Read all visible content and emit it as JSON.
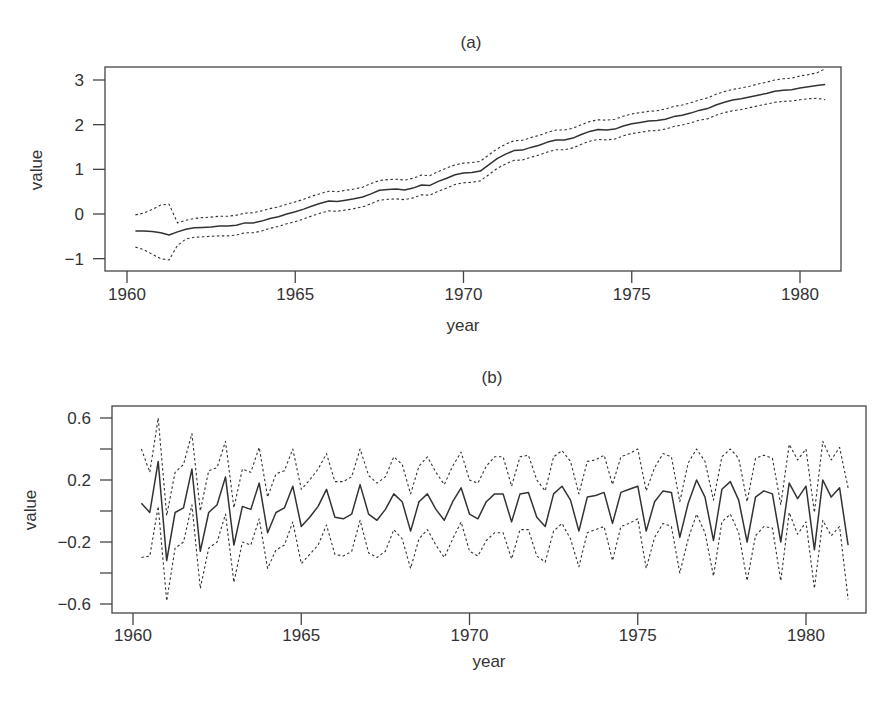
{
  "chart_data": [
    {
      "type": "line",
      "title": "(a)",
      "xlabel": "year",
      "ylabel": "value",
      "xlim": [
        1960,
        1981
      ],
      "ylim": [
        -1.2,
        3.3
      ],
      "xticks": [
        1960,
        1965,
        1970,
        1975,
        1980
      ],
      "yticks": [
        -1,
        0,
        1,
        2,
        3
      ],
      "ytick_labels": [
        "−1",
        "0",
        "1",
        "2",
        "3"
      ],
      "grid": false,
      "legend": null,
      "x_start": 1960.25,
      "x_step": 0.25,
      "series": [
        {
          "name": "estimate",
          "style": "solid",
          "values": [
            -0.38,
            -0.38,
            -0.39,
            -0.42,
            -0.47,
            -0.4,
            -0.34,
            -0.31,
            -0.3,
            -0.29,
            -0.27,
            -0.27,
            -0.25,
            -0.2,
            -0.2,
            -0.16,
            -0.1,
            -0.06,
            0.0,
            0.05,
            0.11,
            0.18,
            0.24,
            0.29,
            0.28,
            0.31,
            0.34,
            0.38,
            0.45,
            0.53,
            0.55,
            0.56,
            0.54,
            0.58,
            0.65,
            0.64,
            0.73,
            0.8,
            0.88,
            0.92,
            0.93,
            0.96,
            1.1,
            1.24,
            1.34,
            1.42,
            1.43,
            1.49,
            1.54,
            1.61,
            1.66,
            1.66,
            1.7,
            1.78,
            1.85,
            1.89,
            1.88,
            1.9,
            1.97,
            2.02,
            2.05,
            2.08,
            2.09,
            2.12,
            2.18,
            2.21,
            2.26,
            2.32,
            2.36,
            2.44,
            2.5,
            2.55,
            2.58,
            2.62,
            2.66,
            2.7,
            2.75,
            2.77,
            2.78,
            2.82,
            2.85,
            2.88,
            2.9
          ]
        },
        {
          "name": "upper",
          "style": "dotted",
          "values": [
            -0.02,
            0.02,
            0.1,
            0.2,
            0.22,
            -0.2,
            -0.14,
            -0.1,
            -0.08,
            -0.07,
            -0.05,
            -0.05,
            -0.03,
            0.02,
            0.03,
            0.07,
            0.12,
            0.16,
            0.22,
            0.27,
            0.33,
            0.4,
            0.46,
            0.51,
            0.5,
            0.53,
            0.56,
            0.6,
            0.68,
            0.75,
            0.77,
            0.78,
            0.76,
            0.8,
            0.87,
            0.86,
            0.95,
            1.03,
            1.1,
            1.14,
            1.15,
            1.18,
            1.32,
            1.46,
            1.56,
            1.64,
            1.65,
            1.71,
            1.76,
            1.83,
            1.88,
            1.88,
            1.92,
            2.0,
            2.07,
            2.11,
            2.1,
            2.12,
            2.19,
            2.24,
            2.27,
            2.3,
            2.31,
            2.35,
            2.41,
            2.44,
            2.49,
            2.55,
            2.6,
            2.68,
            2.74,
            2.79,
            2.82,
            2.86,
            2.91,
            2.95,
            3.0,
            3.03,
            3.04,
            3.09,
            3.12,
            3.16,
            3.25
          ]
        },
        {
          "name": "lower",
          "style": "dotted",
          "values": [
            -0.74,
            -0.8,
            -0.9,
            -1.0,
            -1.03,
            -0.7,
            -0.56,
            -0.52,
            -0.51,
            -0.5,
            -0.49,
            -0.49,
            -0.47,
            -0.42,
            -0.42,
            -0.38,
            -0.32,
            -0.28,
            -0.22,
            -0.17,
            -0.11,
            -0.04,
            0.02,
            0.07,
            0.06,
            0.09,
            0.12,
            0.16,
            0.23,
            0.31,
            0.33,
            0.34,
            0.32,
            0.36,
            0.43,
            0.42,
            0.51,
            0.58,
            0.66,
            0.7,
            0.71,
            0.74,
            0.88,
            1.02,
            1.12,
            1.2,
            1.21,
            1.27,
            1.32,
            1.39,
            1.44,
            1.44,
            1.48,
            1.56,
            1.63,
            1.67,
            1.66,
            1.68,
            1.75,
            1.8,
            1.83,
            1.86,
            1.87,
            1.9,
            1.96,
            1.99,
            2.04,
            2.1,
            2.13,
            2.21,
            2.27,
            2.31,
            2.34,
            2.38,
            2.42,
            2.46,
            2.5,
            2.52,
            2.53,
            2.56,
            2.58,
            2.59,
            2.56
          ]
        }
      ]
    },
    {
      "type": "line",
      "title": "(b)",
      "xlabel": "year",
      "ylabel": "value",
      "xlim": [
        1960,
        1981
      ],
      "ylim": [
        -0.67,
        0.64
      ],
      "xticks": [
        1960,
        1965,
        1970,
        1975,
        1980
      ],
      "yticks": [
        -0.6,
        -0.4,
        -0.2,
        0.0,
        0.2,
        0.4,
        0.6
      ],
      "ytick_labels": [
        "−0.6",
        "",
        "−0.2",
        "",
        "0.2",
        "",
        "0.6"
      ],
      "grid": false,
      "legend": null,
      "x_start": 1960.25,
      "x_step": 0.25,
      "series": [
        {
          "name": "estimate",
          "style": "solid",
          "values": [
            0.05,
            -0.01,
            0.32,
            -0.32,
            -0.01,
            0.02,
            0.27,
            -0.26,
            -0.01,
            0.04,
            0.22,
            -0.22,
            0.03,
            0.01,
            0.18,
            -0.14,
            -0.01,
            0.02,
            0.16,
            -0.1,
            -0.04,
            0.03,
            0.14,
            -0.04,
            -0.05,
            -0.02,
            0.17,
            -0.02,
            -0.06,
            0.01,
            0.11,
            0.06,
            -0.13,
            0.06,
            0.11,
            0.01,
            -0.06,
            0.06,
            0.15,
            -0.02,
            -0.05,
            0.06,
            0.11,
            0.11,
            -0.07,
            0.11,
            0.12,
            -0.04,
            -0.1,
            0.11,
            0.16,
            0.07,
            -0.13,
            0.09,
            0.1,
            0.12,
            -0.08,
            0.12,
            0.14,
            0.16,
            -0.13,
            0.06,
            0.13,
            0.12,
            -0.17,
            0.05,
            0.2,
            0.09,
            -0.19,
            0.14,
            0.19,
            0.07,
            -0.2,
            0.09,
            0.13,
            0.11,
            -0.2,
            0.18,
            0.08,
            0.16,
            -0.25,
            0.2,
            0.09,
            0.15,
            -0.22
          ]
        },
        {
          "name": "upper",
          "style": "dotted",
          "values": [
            0.4,
            0.25,
            0.6,
            -0.03,
            0.25,
            0.3,
            0.5,
            0.0,
            0.26,
            0.28,
            0.45,
            0.02,
            0.27,
            0.25,
            0.41,
            0.09,
            0.24,
            0.26,
            0.4,
            0.14,
            0.2,
            0.27,
            0.37,
            0.19,
            0.19,
            0.22,
            0.4,
            0.23,
            0.18,
            0.22,
            0.35,
            0.3,
            0.11,
            0.29,
            0.35,
            0.25,
            0.17,
            0.29,
            0.38,
            0.2,
            0.18,
            0.29,
            0.35,
            0.35,
            0.16,
            0.35,
            0.36,
            0.2,
            0.13,
            0.35,
            0.39,
            0.32,
            0.11,
            0.32,
            0.33,
            0.36,
            0.17,
            0.35,
            0.37,
            0.4,
            0.13,
            0.28,
            0.37,
            0.35,
            0.06,
            0.31,
            0.4,
            0.32,
            0.07,
            0.35,
            0.4,
            0.34,
            0.06,
            0.34,
            0.36,
            0.34,
            0.04,
            0.43,
            0.33,
            0.4,
            -0.01,
            0.45,
            0.33,
            0.41,
            0.15
          ]
        },
        {
          "name": "lower",
          "style": "dotted",
          "values": [
            -0.3,
            -0.29,
            0.03,
            -0.58,
            -0.24,
            -0.2,
            0.04,
            -0.5,
            -0.24,
            -0.2,
            -0.02,
            -0.46,
            -0.2,
            -0.22,
            -0.05,
            -0.37,
            -0.25,
            -0.22,
            -0.07,
            -0.34,
            -0.28,
            -0.22,
            -0.09,
            -0.28,
            -0.29,
            -0.26,
            -0.06,
            -0.27,
            -0.3,
            -0.26,
            -0.12,
            -0.18,
            -0.37,
            -0.18,
            -0.12,
            -0.22,
            -0.3,
            -0.18,
            -0.07,
            -0.26,
            -0.29,
            -0.19,
            -0.14,
            -0.14,
            -0.31,
            -0.12,
            -0.12,
            -0.29,
            -0.33,
            -0.13,
            -0.08,
            -0.18,
            -0.36,
            -0.14,
            -0.12,
            -0.1,
            -0.32,
            -0.1,
            -0.08,
            -0.05,
            -0.37,
            -0.17,
            -0.08,
            -0.1,
            -0.4,
            -0.18,
            -0.02,
            -0.14,
            -0.42,
            -0.07,
            -0.02,
            -0.14,
            -0.45,
            -0.16,
            -0.1,
            -0.11,
            -0.45,
            -0.01,
            -0.15,
            -0.07,
            -0.5,
            -0.06,
            -0.16,
            -0.1,
            -0.57
          ]
        }
      ]
    }
  ],
  "panels": {
    "a": {
      "title": "(a)",
      "xlabel": "year",
      "ylabel": "value"
    },
    "b": {
      "title": "(b)",
      "xlabel": "year",
      "ylabel": "value"
    }
  }
}
